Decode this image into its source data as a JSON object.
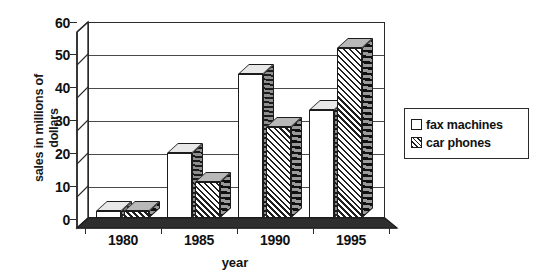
{
  "chart_data": {
    "type": "bar",
    "title": "",
    "subtitle": "",
    "xlabel": "year",
    "ylabel": "sales in millions of dollars",
    "ylabel_lines": [
      "sales in millions of",
      "dollars"
    ],
    "categories": [
      "1980",
      "1985",
      "1990",
      "1995"
    ],
    "series": [
      {
        "name": "fax machines",
        "values": [
          2,
          20,
          44,
          33
        ],
        "pattern": "solid-white"
      },
      {
        "name": "car phones",
        "values": [
          2,
          11,
          28,
          52
        ],
        "pattern": "diagonal-hatch"
      }
    ],
    "ylim": [
      0,
      60
    ],
    "yticks": [
      0,
      10,
      20,
      30,
      40,
      50,
      60
    ],
    "ytick_labels": [
      "0",
      "10",
      "20",
      "30",
      "40",
      "50",
      "60"
    ],
    "xtick_labels": [
      "1980",
      "1985",
      "1990",
      "1995"
    ],
    "grid": true,
    "grid_axis": "y",
    "legend_position": "right",
    "style": "3d-bar",
    "colors": {
      "axis": "#2b2b2b",
      "grid": "#4a4a4a",
      "fax_machines": "#ffffff",
      "car_phones": "#cfcfcf",
      "text": "#111111",
      "background": "#ffffff"
    }
  },
  "legend": {
    "items": [
      {
        "label": "fax machines",
        "swatch": "white-square-icon"
      },
      {
        "label": "car phones",
        "swatch": "hatched-square-icon"
      }
    ]
  }
}
